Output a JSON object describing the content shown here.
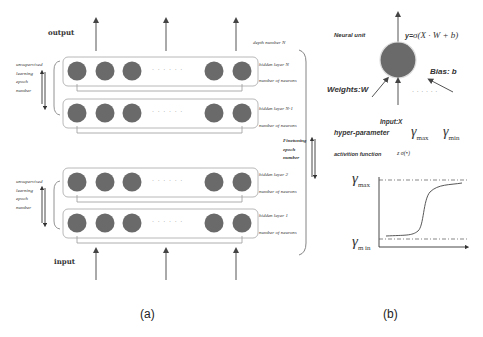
{
  "panel_a": {
    "caption": "(a)",
    "output_label": "output",
    "input_label": "input",
    "depth_label": "depth number N",
    "finetuning_label": [
      "Finetuning",
      "epoch",
      "number"
    ],
    "unsupervised_top": [
      "unsupervised",
      "learning",
      "epoch",
      "number"
    ],
    "unsupervised_bottom": [
      "unsupervised",
      "learning",
      "epoch",
      "number"
    ],
    "ellipsis": "· · · · · ·",
    "layers": [
      {
        "name": "hidden layer N",
        "neurons_label": "number of neurons"
      },
      {
        "name": "hidden layer N-1",
        "neurons_label": "number of neurons"
      },
      {
        "name": "hidden layer 2",
        "neurons_label": "number of neurons"
      },
      {
        "name": "hidden layer 1",
        "neurons_label": "number of neurons"
      }
    ]
  },
  "panel_b": {
    "caption": "(b)",
    "neural_unit_label": "Neural unit",
    "formula": "y= σ(X · W + b)",
    "formula_y": "y=",
    "formula_rhs": "σ(X · W + b)",
    "weights_label": "Weights:W",
    "bias_label": "Bias: b",
    "input_label": "Input:X",
    "ellipsis": "· · · · · ·",
    "hyper_parameter_label": "hyper-parameter",
    "gamma_max": "γ",
    "gamma_max_sub": "max",
    "gamma_min": "γ",
    "gamma_min_sub": "min",
    "activation_label": "activition function",
    "activation_symbol": "z  σ(•)",
    "plot_ymax_label": "γ",
    "plot_ymax_sub": "max",
    "plot_ymin_label": "γ",
    "plot_ymin_sub": "m in"
  },
  "colors": {
    "neuron": "#6a6a6a",
    "box_border": "#b8b8b8",
    "line": "#555555"
  }
}
